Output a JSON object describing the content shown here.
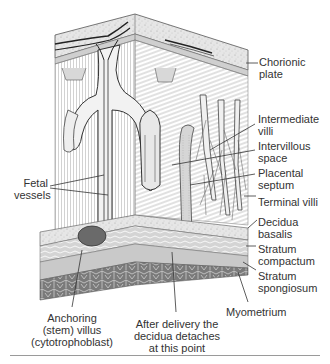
{
  "figure": {
    "labels_right": [
      {
        "id": "chorionic-plate",
        "lines": [
          "Chorionic",
          "plate"
        ]
      },
      {
        "id": "intermediate-villi",
        "lines": [
          "Intermediate",
          "villi"
        ]
      },
      {
        "id": "intervillous-space",
        "lines": [
          "Intervillous",
          "space"
        ]
      },
      {
        "id": "placental-septum",
        "lines": [
          "Placental",
          "septum"
        ]
      },
      {
        "id": "terminal-villi",
        "lines": [
          "Terminal villi"
        ]
      },
      {
        "id": "decidua-basalis",
        "lines": [
          "Decidua",
          "basalis"
        ]
      },
      {
        "id": "stratum-compactum",
        "lines": [
          "Stratum",
          "compactum"
        ]
      },
      {
        "id": "stratum-spongiosum",
        "lines": [
          "Stratum",
          "spongiosum"
        ]
      },
      {
        "id": "myometrium",
        "lines": [
          "Myometrium"
        ]
      }
    ],
    "labels_left": [
      {
        "id": "fetal-vessels",
        "lines": [
          "Fetal",
          "vessels"
        ]
      }
    ],
    "labels_bottom": [
      {
        "id": "anchoring-villus",
        "lines": [
          "Anchoring",
          "(stem) villus",
          "(cytotrophoblast)"
        ]
      },
      {
        "id": "decidua-detach",
        "lines": [
          "After delivery the",
          "decidua detaches",
          "at this point"
        ]
      }
    ]
  },
  "colors": {
    "ink": "#2a2a2a",
    "hatch": "#8a8a8a",
    "fill_light": "#e4e4e4",
    "fill_mid": "#c8c8c8",
    "fill_dark": "#6e6e6e",
    "rule": "#9a9a9a"
  }
}
